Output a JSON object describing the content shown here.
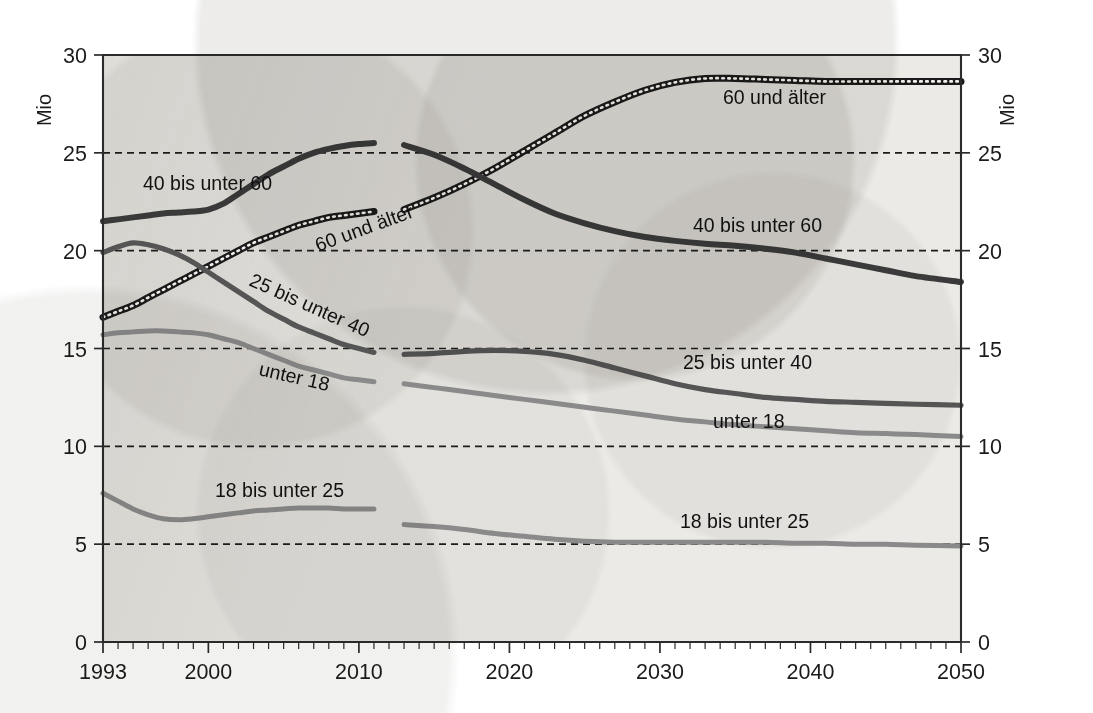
{
  "chart_data": {
    "type": "line",
    "title": "",
    "subtitle": "",
    "xlabel": "",
    "ylabel": "Mio",
    "ylabel_right": "Mio",
    "xlim": [
      1993,
      2050
    ],
    "ylim": [
      0,
      30
    ],
    "y_ticks": [
      0,
      5,
      10,
      15,
      20,
      25,
      30
    ],
    "y_tick_labels": [
      "0",
      "5",
      "10",
      "15",
      "20",
      "25",
      "30"
    ],
    "x_ticks": [
      1993,
      2000,
      2010,
      2020,
      2030,
      2040,
      2050
    ],
    "x_tick_labels": [
      "1993",
      "2000",
      "2010",
      "2020",
      "2030",
      "2040",
      "2050"
    ],
    "x_minor_tick_step": 1,
    "grid": "horizontal-dashed",
    "legend_position": "inline-annotations",
    "series": [
      {
        "name": "60 und älter",
        "style": "dotted-thick-dark",
        "color": "#1a1a1a",
        "segments": [
          {
            "phase": "history",
            "x": [
              1993,
              1994,
              1995,
              1996,
              1997,
              1998,
              1999,
              2000,
              2001,
              2002,
              2003,
              2004,
              2005,
              2006,
              2007,
              2008,
              2009,
              2010,
              2011
            ],
            "y": [
              16.6,
              16.9,
              17.2,
              17.6,
              18.0,
              18.4,
              18.8,
              19.2,
              19.6,
              20.0,
              20.4,
              20.7,
              21.0,
              21.3,
              21.5,
              21.7,
              21.8,
              21.9,
              22.0
            ]
          },
          {
            "phase": "projection",
            "x": [
              2013,
              2015,
              2017,
              2019,
              2021,
              2023,
              2025,
              2027,
              2029,
              2031,
              2033,
              2035,
              2037,
              2039,
              2041,
              2043,
              2045,
              2047,
              2050
            ],
            "y": [
              22.1,
              22.7,
              23.4,
              24.2,
              25.1,
              26.0,
              26.9,
              27.6,
              28.2,
              28.6,
              28.8,
              28.8,
              28.75,
              28.7,
              28.65,
              28.65,
              28.65,
              28.65,
              28.65
            ]
          }
        ]
      },
      {
        "name": "40 bis unter 60",
        "style": "solid-thick-dark",
        "color": "#3a3a3a",
        "segments": [
          {
            "phase": "history",
            "x": [
              1993,
              1994,
              1995,
              1996,
              1997,
              1998,
              1999,
              2000,
              2001,
              2002,
              2003,
              2004,
              2005,
              2006,
              2007,
              2008,
              2009,
              2010,
              2011
            ],
            "y": [
              21.5,
              21.6,
              21.7,
              21.8,
              21.9,
              21.95,
              22.0,
              22.1,
              22.4,
              22.9,
              23.4,
              23.9,
              24.3,
              24.7,
              25.0,
              25.2,
              25.35,
              25.45,
              25.5
            ]
          },
          {
            "phase": "projection",
            "x": [
              2013,
              2015,
              2017,
              2019,
              2021,
              2023,
              2025,
              2027,
              2029,
              2031,
              2033,
              2035,
              2037,
              2039,
              2041,
              2043,
              2045,
              2047,
              2050
            ],
            "y": [
              25.4,
              24.9,
              24.2,
              23.4,
              22.6,
              21.9,
              21.4,
              21.0,
              20.7,
              20.5,
              20.35,
              20.25,
              20.1,
              19.9,
              19.6,
              19.3,
              19.0,
              18.7,
              18.4
            ]
          }
        ]
      },
      {
        "name": "25 bis unter 40",
        "style": "solid-medium-dark",
        "color": "#555555",
        "segments": [
          {
            "phase": "history",
            "x": [
              1993,
              1994,
              1995,
              1996,
              1997,
              1998,
              1999,
              2000,
              2001,
              2002,
              2003,
              2004,
              2005,
              2006,
              2007,
              2008,
              2009,
              2010,
              2011
            ],
            "y": [
              19.9,
              20.2,
              20.4,
              20.3,
              20.1,
              19.8,
              19.4,
              18.9,
              18.4,
              17.9,
              17.4,
              16.9,
              16.5,
              16.1,
              15.8,
              15.5,
              15.2,
              15.0,
              14.8
            ]
          },
          {
            "phase": "projection",
            "x": [
              2013,
              2015,
              2017,
              2019,
              2021,
              2023,
              2025,
              2027,
              2029,
              2031,
              2033,
              2035,
              2037,
              2039,
              2041,
              2043,
              2045,
              2047,
              2050
            ],
            "y": [
              14.7,
              14.75,
              14.85,
              14.9,
              14.85,
              14.7,
              14.4,
              14.0,
              13.6,
              13.2,
              12.9,
              12.7,
              12.5,
              12.4,
              12.3,
              12.25,
              12.2,
              12.15,
              12.1
            ]
          }
        ]
      },
      {
        "name": "unter 18",
        "style": "solid-medium-gray",
        "color": "#8a8a8a",
        "segments": [
          {
            "phase": "history",
            "x": [
              1993,
              1994,
              1995,
              1996,
              1997,
              1998,
              1999,
              2000,
              2001,
              2002,
              2003,
              2004,
              2005,
              2006,
              2007,
              2008,
              2009,
              2010,
              2011
            ],
            "y": [
              15.7,
              15.8,
              15.85,
              15.9,
              15.9,
              15.85,
              15.8,
              15.7,
              15.5,
              15.3,
              15.0,
              14.7,
              14.4,
              14.1,
              13.9,
              13.7,
              13.5,
              13.4,
              13.3
            ]
          },
          {
            "phase": "projection",
            "x": [
              2013,
              2015,
              2017,
              2019,
              2021,
              2023,
              2025,
              2027,
              2029,
              2031,
              2033,
              2035,
              2037,
              2039,
              2041,
              2043,
              2045,
              2047,
              2050
            ],
            "y": [
              13.2,
              13.0,
              12.8,
              12.6,
              12.4,
              12.2,
              12.0,
              11.8,
              11.6,
              11.4,
              11.25,
              11.1,
              11.0,
              10.9,
              10.8,
              10.7,
              10.65,
              10.6,
              10.5
            ]
          }
        ]
      },
      {
        "name": "18 bis unter 25",
        "style": "solid-medium-gray",
        "color": "#8a8a8a",
        "segments": [
          {
            "phase": "history",
            "x": [
              1993,
              1994,
              1995,
              1996,
              1997,
              1998,
              1999,
              2000,
              2001,
              2002,
              2003,
              2004,
              2005,
              2006,
              2007,
              2008,
              2009,
              2010,
              2011
            ],
            "y": [
              7.6,
              7.2,
              6.8,
              6.5,
              6.3,
              6.25,
              6.3,
              6.4,
              6.5,
              6.6,
              6.7,
              6.75,
              6.8,
              6.85,
              6.85,
              6.85,
              6.8,
              6.8,
              6.8
            ]
          },
          {
            "phase": "projection",
            "x": [
              2013,
              2015,
              2017,
              2019,
              2021,
              2023,
              2025,
              2027,
              2029,
              2031,
              2033,
              2035,
              2037,
              2039,
              2041,
              2043,
              2045,
              2047,
              2050
            ],
            "y": [
              6.0,
              5.9,
              5.75,
              5.55,
              5.4,
              5.25,
              5.15,
              5.1,
              5.1,
              5.1,
              5.1,
              5.1,
              5.1,
              5.05,
              5.05,
              5.0,
              5.0,
              4.95,
              4.9
            ]
          }
        ]
      }
    ],
    "annotations": [
      {
        "text": "40 bis unter 60",
        "x": 143,
        "y": 190,
        "rotate": 0
      },
      {
        "text": "60 und älter",
        "x": 318,
        "y": 252,
        "rotate": -20
      },
      {
        "text": "25 bis unter 40",
        "x": 248,
        "y": 285,
        "rotate": 24
      },
      {
        "text": "unter 18",
        "x": 258,
        "y": 375,
        "rotate": 13
      },
      {
        "text": "18 bis unter 25",
        "x": 215,
        "y": 497,
        "rotate": 0
      },
      {
        "text": "60 und älter",
        "x": 723,
        "y": 104,
        "rotate": 0
      },
      {
        "text": "40 bis unter 60",
        "x": 693,
        "y": 232,
        "rotate": 0
      },
      {
        "text": "25 bis unter 40",
        "x": 683,
        "y": 369,
        "rotate": 0
      },
      {
        "text": "unter 18",
        "x": 713,
        "y": 428,
        "rotate": 0
      },
      {
        "text": "18 bis unter 25",
        "x": 680,
        "y": 528,
        "rotate": 0
      }
    ]
  },
  "colors": {
    "paper": "#eceae6",
    "ink": "#1b1b1b",
    "grid": "#1c1c1c"
  }
}
